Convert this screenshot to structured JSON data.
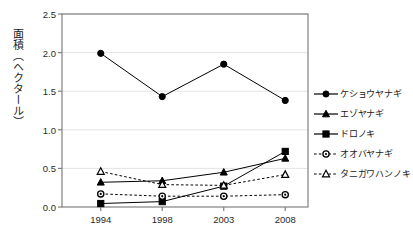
{
  "chart_data": {
    "type": "line",
    "title": "",
    "xlabel": "",
    "ylabel": "面積（ヘクタール）",
    "categories": [
      "1994",
      "1998",
      "2003",
      "2008"
    ],
    "x": [
      1994,
      1998,
      2003,
      2008
    ],
    "ylim": [
      0.0,
      2.5
    ],
    "yticks": [
      "0.0",
      "0.5",
      "1.0",
      "1.5",
      "2.0",
      "2.5"
    ],
    "ytick_values": [
      0.0,
      0.5,
      1.0,
      1.5,
      2.0,
      2.5
    ],
    "grid": "horizontal",
    "legend_position": "right",
    "series": [
      {
        "name": "ケショウヤナギ",
        "marker": "filled-circle",
        "line": "solid",
        "color": "#000000",
        "values": [
          1.99,
          1.43,
          1.85,
          1.38
        ]
      },
      {
        "name": "エゾヤナギ",
        "marker": "filled-triangle",
        "line": "solid",
        "color": "#000000",
        "values": [
          0.32,
          0.34,
          0.45,
          0.63
        ]
      },
      {
        "name": "ドロノキ",
        "marker": "filled-square",
        "line": "solid",
        "color": "#000000",
        "values": [
          0.045,
          0.07,
          0.27,
          0.72
        ]
      },
      {
        "name": "オオバヤナギ",
        "marker": "open-circle",
        "line": "dashed",
        "color": "#000000",
        "values": [
          0.17,
          0.14,
          0.14,
          0.16
        ]
      },
      {
        "name": "タニガワハンノキ",
        "marker": "open-triangle",
        "line": "dashed",
        "color": "#000000",
        "values": [
          0.46,
          0.29,
          0.28,
          0.42
        ]
      }
    ]
  },
  "axes": {
    "frame_color": "#808080",
    "grid_color": "#e4e4e4"
  }
}
